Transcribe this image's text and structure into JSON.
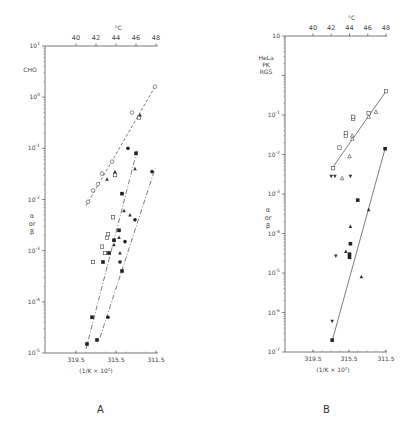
{
  "chart_data": [
    {
      "panel": "A",
      "type": "scatter",
      "title": "CHO",
      "ylabel": "α or β",
      "xlabel": "(1/K × 10^5)",
      "top_axis_label": "°C",
      "yscale": "log",
      "ylim": [
        1e-05,
        10
      ],
      "ytick_labels": [
        "10^1",
        "10^0",
        "10^-1",
        "10^-2",
        "10^-3",
        "10^-4",
        "10^-5"
      ],
      "ytick_values": [
        10,
        1,
        0.1,
        0.01,
        0.001,
        0.0001,
        1e-05
      ],
      "top_xtick_labels": [
        "40",
        "42",
        "44",
        "46",
        "48"
      ],
      "bottom_xtick_labels": [
        "319.5",
        "315.5",
        "311.5"
      ],
      "grid": false,
      "series": [
        {
          "name": "open circles (dashed fit)",
          "marker": "circle-open",
          "points": [
            [
              41.2,
              0.009
            ],
            [
              41.7,
              0.015
            ],
            [
              42.2,
              0.02
            ],
            [
              42.6,
              0.032
            ],
            [
              43.6,
              0.055
            ],
            [
              45.6,
              0.5
            ],
            [
              47.9,
              1.6
            ]
          ]
        },
        {
          "name": "open squares",
          "marker": "square-open",
          "points": [
            [
              41.7,
              0.0006
            ],
            [
              42.6,
              0.0012
            ],
            [
              43.1,
              0.0018
            ],
            [
              43.2,
              0.0021
            ],
            [
              43.9,
              0.03
            ],
            [
              43.7,
              0.0045
            ],
            [
              46.3,
              0.4
            ],
            [
              42.9,
              0.0009
            ]
          ]
        },
        {
          "name": "filled triangles",
          "marker": "triangle-filled",
          "points": [
            [
              43.1,
              0.025
            ],
            [
              43.9,
              0.035
            ],
            [
              44.8,
              0.006
            ],
            [
              45.9,
              0.04
            ],
            [
              45.4,
              0.005
            ],
            [
              44.3,
              0.0018
            ],
            [
              43.8,
              0.0013
            ],
            [
              44.4,
              0.0009
            ],
            [
              46.4,
              0.45
            ]
          ]
        },
        {
          "name": "filled squares (dash-dot fit)",
          "marker": "square-filled",
          "points": [
            [
              41.1,
              1.5e-05
            ],
            [
              41.6,
              5e-05
            ],
            [
              42.1,
              1.8e-05
            ],
            [
              42.7,
              0.0006
            ],
            [
              43.3,
              0.0009
            ],
            [
              44.6,
              0.0004
            ],
            [
              43.8,
              0.0016
            ],
            [
              44.3,
              0.0025
            ],
            [
              44.6,
              0.013
            ],
            [
              46.0,
              0.08
            ]
          ]
        },
        {
          "name": "filled circles (dash-dot fit 2)",
          "marker": "circle-filled",
          "points": [
            [
              43.2,
              5e-05
            ],
            [
              44.4,
              0.0006
            ],
            [
              45.9,
              0.004
            ],
            [
              47.6,
              0.035
            ],
            [
              45.2,
              0.1
            ],
            [
              44.9,
              0.0015
            ]
          ]
        }
      ],
      "fit_lines": [
        {
          "style": "dashed",
          "from": [
            41.0,
            0.0075
          ],
          "to": [
            47.9,
            1.6
          ]
        },
        {
          "style": "dash-dot",
          "from": [
            41.0,
            1.2e-05
          ],
          "to": [
            46.1,
            0.09
          ]
        },
        {
          "style": "dash-dot",
          "from": [
            42.4,
            2e-05
          ],
          "to": [
            47.9,
            0.04
          ]
        }
      ]
    },
    {
      "panel": "B",
      "type": "scatter",
      "title": "HeLa PK RGS",
      "ylabel": "α or β",
      "xlabel": "(1/K × 10^5)",
      "top_axis_label": "°C",
      "yscale": "log",
      "ylim": [
        1e-07,
        10
      ],
      "ytick_labels": [
        "10",
        "10^-1",
        "10^-2",
        "10^-3",
        "10^-4",
        "10^-5",
        "10^-6",
        "10^-7"
      ],
      "ytick_values": [
        10,
        0.1,
        0.01,
        0.001,
        0.0001,
        1e-05,
        1e-06,
        1e-07
      ],
      "top_xtick_labels": [
        "40",
        "42",
        "44",
        "46",
        "48"
      ],
      "bottom_xtick_labels": [
        "319.5",
        "315.5",
        "311.5"
      ],
      "grid": false,
      "series": [
        {
          "name": "open circles/squares (upper fit)",
          "marker": "square-open",
          "points": [
            [
              42.2,
              0.0045
            ],
            [
              42.9,
              0.015
            ],
            [
              43.6,
              0.03
            ],
            [
              43.6,
              0.035
            ],
            [
              44.4,
              0.08
            ],
            [
              44.4,
              0.09
            ],
            [
              46.1,
              0.11
            ],
            [
              48.0,
              0.4
            ]
          ]
        },
        {
          "name": "open triangles",
          "marker": "triangle-open",
          "points": [
            [
              43.2,
              0.0025
            ],
            [
              44.0,
              0.009
            ],
            [
              46.1,
              0.09
            ],
            [
              46.9,
              0.12
            ],
            [
              44.3,
              0.025
            ],
            [
              44.3,
              0.03
            ]
          ]
        },
        {
          "name": "filled inverted triangles",
          "marker": "triangle-down-filled",
          "points": [
            [
              42.0,
              0.0028
            ],
            [
              42.4,
              0.0028
            ],
            [
              44.1,
              0.0028
            ],
            [
              42.5,
              2.7e-05
            ],
            [
              42.1,
              6e-07
            ]
          ]
        },
        {
          "name": "filled squares (lower fit)",
          "marker": "square-filled",
          "points": [
            [
              42.1,
              2e-07
            ],
            [
              44.1,
              5.5e-05
            ],
            [
              44.9,
              0.0007
            ],
            [
              47.9,
              0.014
            ],
            [
              44.0,
              3e-05
            ],
            [
              44.0,
              2.5e-05
            ]
          ]
        },
        {
          "name": "filled triangles",
          "marker": "triangle-filled",
          "points": [
            [
              44.1,
              0.00015
            ],
            [
              46.1,
              0.0004
            ],
            [
              45.3,
              8e-06
            ],
            [
              43.6,
              3.5e-05
            ]
          ]
        }
      ],
      "fit_lines": [
        {
          "style": "solid",
          "from": [
            42.1,
            0.0045
          ],
          "to": [
            48.0,
            0.4
          ]
        },
        {
          "style": "solid",
          "from": [
            42.1,
            1.9e-07
          ],
          "to": [
            47.9,
            0.014
          ]
        }
      ]
    }
  ],
  "panels": {
    "A": {
      "label": "A",
      "cell_line": "CHO",
      "ylabel_lines": [
        "α",
        "or",
        "β"
      ],
      "top_unit": "°C",
      "xlabel": "(1/K × 10⁵)"
    },
    "B": {
      "label": "B",
      "cell_lines": [
        "HeLa",
        "PK",
        "RGS"
      ],
      "ylabel_lines": [
        "α",
        "or",
        "β"
      ],
      "top_unit": "°C",
      "xlabel": "(1/K × 10⁵)"
    }
  }
}
